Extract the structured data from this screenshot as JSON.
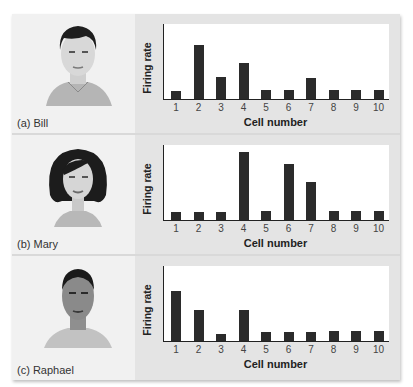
{
  "panels": [
    {
      "caption": "(a) Bill",
      "person": "Bill",
      "face": "male-face-light-skin-dark-hair"
    },
    {
      "caption": "(b) Mary",
      "person": "Mary",
      "face": "female-face-dark-bob-hair"
    },
    {
      "caption": "(c) Raphael",
      "person": "Raphael",
      "face": "male-face-darker-skin-short-hair"
    }
  ],
  "axis": {
    "xlabel": "Cell number",
    "ylabel": "Firing rate"
  },
  "ticks": [
    "1",
    "2",
    "3",
    "4",
    "5",
    "6",
    "7",
    "8",
    "9",
    "10"
  ],
  "colors": {
    "bar": "#2b2b2b",
    "plot_bg": "#ffffff",
    "chart_panel_bg": "#e4e4e4",
    "face_panel_bg": "#f1f1f1"
  },
  "chart_data": [
    {
      "type": "bar",
      "title": "(a) Bill",
      "categories": [
        "1",
        "2",
        "3",
        "4",
        "5",
        "6",
        "7",
        "8",
        "9",
        "10"
      ],
      "values": [
        1.1,
        7.2,
        3.0,
        4.8,
        1.2,
        1.2,
        2.8,
        1.2,
        1.2,
        1.2
      ],
      "xlabel": "Cell number",
      "ylabel": "Firing rate",
      "ylim": [
        0,
        10
      ],
      "grid": false
    },
    {
      "type": "bar",
      "title": "(b) Mary",
      "categories": [
        "1",
        "2",
        "3",
        "4",
        "5",
        "6",
        "7",
        "8",
        "9",
        "10"
      ],
      "values": [
        1.1,
        1.1,
        1.1,
        9.1,
        1.2,
        7.5,
        5.1,
        1.2,
        1.2,
        1.2
      ],
      "xlabel": "Cell number",
      "ylabel": "Firing rate",
      "ylim": [
        0,
        10
      ],
      "grid": false
    },
    {
      "type": "bar",
      "title": "(c) Raphael",
      "categories": [
        "1",
        "2",
        "3",
        "4",
        "5",
        "6",
        "7",
        "8",
        "9",
        "10"
      ],
      "values": [
        6.7,
        4.2,
        0.9,
        4.2,
        1.2,
        1.2,
        1.2,
        1.3,
        1.3,
        1.3
      ],
      "xlabel": "Cell number",
      "ylabel": "Firing rate",
      "ylim": [
        0,
        10
      ],
      "grid": false
    }
  ]
}
